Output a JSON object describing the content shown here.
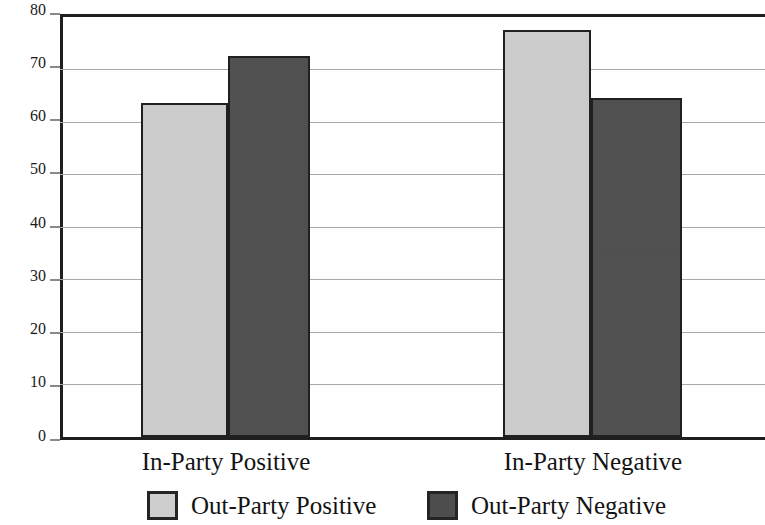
{
  "chart_data": {
    "type": "bar",
    "title": "",
    "subtitle": "",
    "xlabel": "",
    "ylabel": "",
    "ylim": [
      0,
      80
    ],
    "ytick_step": 10,
    "yticks": [
      "80",
      "70",
      "60",
      "50",
      "40",
      "30",
      "20",
      "10",
      "0"
    ],
    "grid": true,
    "grid_axis": "y",
    "legend_position": "bottom",
    "categories": [
      "In-Party Positive",
      "In-Party Negative"
    ],
    "series": [
      {
        "name": "Out-Party Positive",
        "values": [
          63,
          77
        ],
        "color": "#d3d3d3"
      },
      {
        "name": "Out-Party Negative",
        "values": [
          72,
          64
        ],
        "color": "#4b4b4b"
      }
    ],
    "bars": [
      {
        "group": "In-Party Positive",
        "series": "Out-Party Positive",
        "value": 63
      },
      {
        "group": "In-Party Positive",
        "series": "Out-Party Negative",
        "value": 72
      },
      {
        "group": "In-Party Negative",
        "series": "Out-Party Positive",
        "value": 77
      },
      {
        "group": "In-Party Negative",
        "series": "Out-Party Negative",
        "value": 64
      }
    ]
  },
  "axis": {
    "y_labels": [
      "80",
      "70",
      "60",
      "50",
      "40",
      "30",
      "20",
      "10",
      "0"
    ]
  },
  "categories": {
    "left": "In-Party Positive",
    "right": "In-Party Negative"
  },
  "legend": {
    "items": [
      {
        "label": "Out-Party Positive",
        "color": "#d3d3d3"
      },
      {
        "label": "Out-Party Negative",
        "color": "#4b4b4b"
      }
    ]
  },
  "colors": {
    "light_bar": "#d3d3d3",
    "dark_bar": "#4b4b4b",
    "axis": "#1f1f1f",
    "gridline": "#a8a8a8",
    "text": "#131313",
    "background": "#ffffff"
  }
}
